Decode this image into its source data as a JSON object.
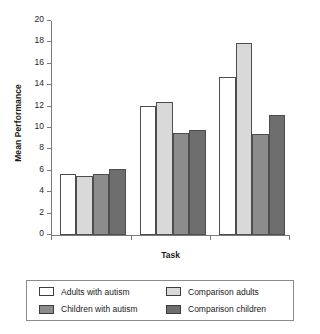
{
  "chart_data": {
    "type": "bar",
    "title": "",
    "xlabel": "Task",
    "ylabel": "Mean Performance",
    "categories": [
      "2-back",
      "Sequencing",
      "Spatial WM"
    ],
    "series": [
      {
        "name": "Adults with autism",
        "color": "#ffffff",
        "values": [
          5.7,
          12.1,
          14.8
        ]
      },
      {
        "name": "Comparison adults",
        "color": "#d9d9d9",
        "values": [
          5.5,
          12.4,
          17.9
        ]
      },
      {
        "name": "Children with autism",
        "color": "#8c8c8c",
        "values": [
          5.7,
          9.5,
          9.4
        ]
      },
      {
        "name": "Comparison children",
        "color": "#6e6e6e",
        "values": [
          6.2,
          9.8,
          11.2
        ]
      }
    ],
    "ylim": [
      0,
      20
    ],
    "ytick_step": 2,
    "yticks": [
      0,
      2,
      4,
      6,
      8,
      10,
      12,
      14,
      16,
      18,
      20
    ],
    "ytick_labels": [
      "0",
      "2",
      "4",
      "6",
      "8",
      "10",
      "12",
      "14",
      "16",
      "18",
      "20"
    ],
    "grid": false,
    "legend_position": "bottom",
    "bar_outline_color": "#4d4d4d",
    "axis_color": "#7a7a7a"
  },
  "legend": {
    "entries": [
      {
        "label": "Adults with autism"
      },
      {
        "label": "Comparison adults"
      },
      {
        "label": "Children with autism"
      },
      {
        "label": "Comparison children"
      }
    ]
  }
}
